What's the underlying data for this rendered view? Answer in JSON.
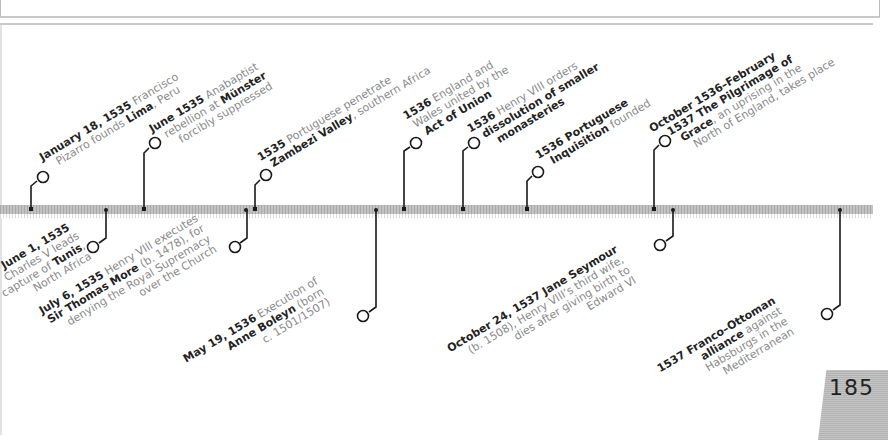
{
  "page": {
    "number": "185"
  },
  "timeline": {
    "above": [
      {
        "date": "January 18, 1535",
        "line1_rest": " Francisco",
        "line2_pre": "Pizarro founds ",
        "line2_em": "Lima",
        "line2_post": ", Peru"
      },
      {
        "date": "June 1535",
        "line1_rest": " Anabaptist",
        "line2_pre": "rebellion at ",
        "line2_em": "Münster",
        "line3": "forcibly suppressed"
      },
      {
        "date": "1535",
        "line1_rest": " Portuguese penetrate",
        "line2_em": "Zambezi Valley",
        "line2_post": ", southern Africa"
      },
      {
        "date": "1536",
        "line1_rest": " England and",
        "line2": "Wales united by the",
        "line3_em": "Act of Union"
      },
      {
        "date": "1536",
        "line1_rest": " Henry VIII orders",
        "line2_em": "dissolution of smaller",
        "line3_em": "monasteries"
      },
      {
        "date": "1536 Portuguese",
        "line2_em": "Inquisition",
        "line2_post": " founded"
      },
      {
        "date": "October 1536–February",
        "line2_em": "1537 The Pilgrimage of",
        "line3_em": "Grace",
        "line3_post": ", an uprising in the",
        "line4": "North of England, takes place"
      }
    ],
    "below": [
      {
        "date": "June 1, 1535",
        "line2": "Charles V leads",
        "line3_pre": "capture of ",
        "line3_em": "Tunis",
        "line3_post": ",",
        "line4": "North Africa"
      },
      {
        "date": "July 6, 1535",
        "line1_rest": " Henry VIII executes",
        "line2_em": "Sir Thomas More",
        "line2_post": " (b. 1478), for",
        "line3": "denying the Royal Supremacy",
        "line4": "over the Church"
      },
      {
        "date": "May 19, 1536",
        "line1_rest": " Execution of",
        "line2_em": "Anne Boleyn",
        "line2_post": " (born",
        "line3": "c. 1501/1507)"
      },
      {
        "date": "October 24, 1537",
        "line1_em": " Jane Seymour",
        "line2": "(b. 1508), Henry VIII’s third wife,",
        "line3": "dies after giving birth to",
        "line4": "Edward VI"
      },
      {
        "date": "1537 Franco–Ottoman",
        "line2_em": "alliance",
        "line2_post": " against",
        "line3": "Habsburgs in the",
        "line4": "Mediterranean"
      }
    ]
  },
  "colors": {
    "bold_text": "#222222",
    "body_text": "#8a8a8a",
    "bar": "#b5b5b5",
    "page_tab": "#bdbdbd"
  }
}
